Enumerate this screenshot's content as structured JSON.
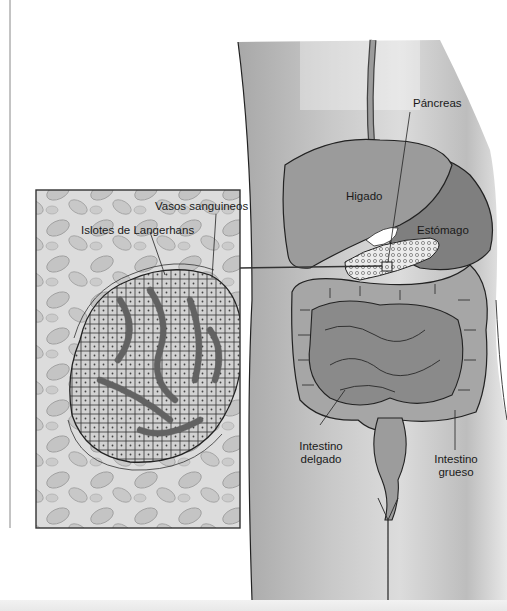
{
  "figure": {
    "inset": {
      "labels": {
        "vessels": "Vasos sanguineos",
        "islets": "Islotes de Langerhans"
      }
    },
    "organs": {
      "pancreas": "Páncreas",
      "liver": "Higado",
      "stomach": "Estómago",
      "small_intestine_line1": "Intestino",
      "small_intestine_line2": "delgado",
      "large_intestine_line1": "Intestino",
      "large_intestine_line2": "grueso"
    },
    "colors": {
      "background": "#ffffff",
      "skin": "#c8c8c8",
      "liver": "#9a9a9a",
      "stomach": "#858585",
      "intestine": "#8f8f8f",
      "pancreas": "#e6e6e6",
      "inset_bg": "#d9d9d9",
      "outline": "#222222"
    }
  }
}
